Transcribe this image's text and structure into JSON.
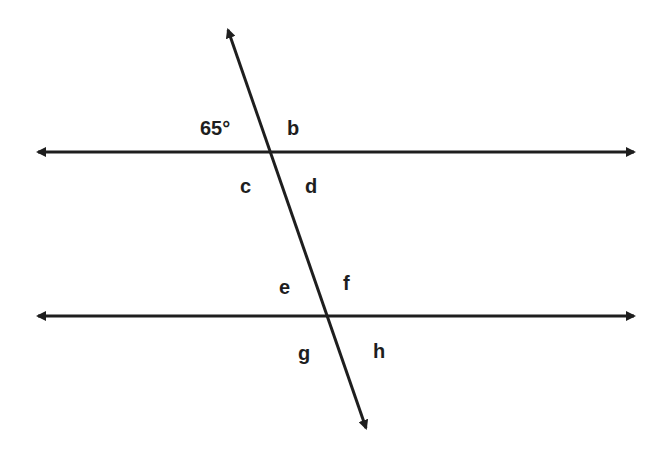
{
  "diagram": {
    "type": "parallel-lines-cut-by-transversal",
    "stroke_color": "#1e1e1e",
    "background": "#ffffff",
    "lines": {
      "top": {
        "x1": 38,
        "y1": 152,
        "x2": 634,
        "y2": 152
      },
      "bottom": {
        "x1": 38,
        "y1": 316,
        "x2": 634,
        "y2": 316
      },
      "transversal": {
        "x1": 228,
        "y1": 30,
        "x2": 366,
        "y2": 428
      }
    },
    "intersections": [
      {
        "x": 268,
        "y": 152
      },
      {
        "x": 326,
        "y": 316
      }
    ],
    "labels": [
      {
        "id": "angle-a",
        "text": "65°",
        "x": 200,
        "y": 118
      },
      {
        "id": "angle-b",
        "text": "b",
        "x": 287,
        "y": 118
      },
      {
        "id": "angle-c",
        "text": "c",
        "x": 240,
        "y": 176
      },
      {
        "id": "angle-d",
        "text": "d",
        "x": 305,
        "y": 176
      },
      {
        "id": "angle-e",
        "text": "e",
        "x": 279,
        "y": 277
      },
      {
        "id": "angle-f",
        "text": "f",
        "x": 343,
        "y": 273
      },
      {
        "id": "angle-g",
        "text": "g",
        "x": 298,
        "y": 343
      },
      {
        "id": "angle-h",
        "text": "h",
        "x": 373,
        "y": 341
      }
    ]
  }
}
